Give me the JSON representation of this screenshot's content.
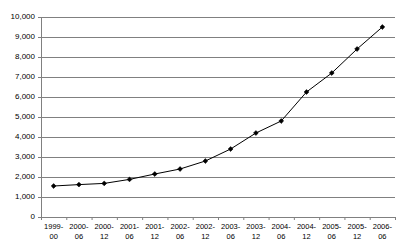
{
  "chart_data": {
    "type": "line",
    "title": "",
    "subtitle": "",
    "xlabel": "",
    "ylabel": "",
    "ylim": [
      0,
      10000
    ],
    "ytick_labels": [
      "10,000",
      "9,000",
      "8,000",
      "7,000",
      "6,000",
      "5,000",
      "4,000",
      "3,000",
      "2,000",
      "1,000",
      "0"
    ],
    "ytick_values": [
      10000,
      9000,
      8000,
      7000,
      6000,
      5000,
      4000,
      3000,
      2000,
      1000,
      0
    ],
    "grid": true,
    "legend": "none",
    "marker": "diamond",
    "line_color": "#000000",
    "marker_color": "#000000",
    "grid_color": "#808080",
    "axis_color": "#808080",
    "categories": [
      "1999-\n00",
      "2000-\n06",
      "2000-\n12",
      "2001-\n06",
      "2001-\n12",
      "2002-\n06",
      "2002-\n12",
      "2003-\n06",
      "2003-\n12",
      "2004-\n06",
      "2004-\n12",
      "2005-\n06",
      "2005-\n12",
      "2006-\n06"
    ],
    "values": [
      1550,
      1620,
      1680,
      1880,
      2150,
      2400,
      2800,
      3400,
      4200,
      4800,
      6250,
      7200,
      8400,
      9500
    ]
  }
}
